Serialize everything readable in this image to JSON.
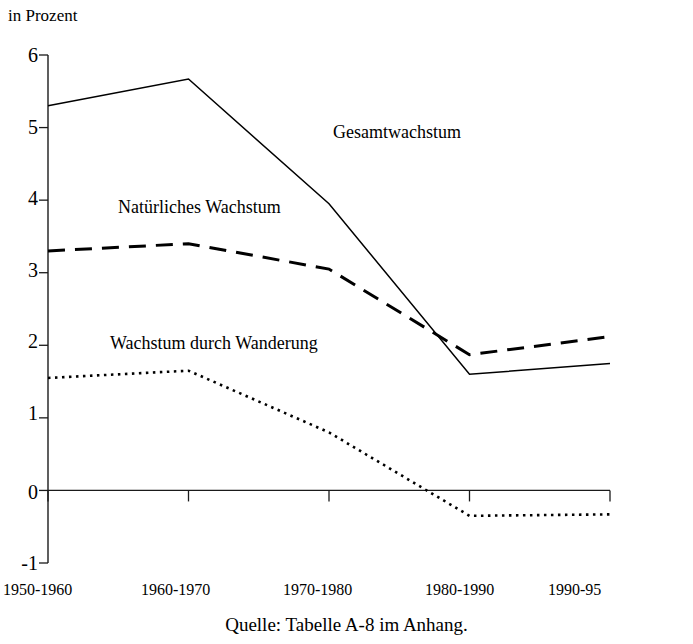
{
  "figure": {
    "unit_label": "in Prozent",
    "source_note": "Quelle: Tabelle A-8 im Anhang."
  },
  "annotations": {
    "total": "Gesamtwachstum",
    "natural": "Natürliches Wachstum",
    "migration": "Wachstum durch Wanderung"
  },
  "axis": {
    "y_ticks": [
      "6",
      "5",
      "4",
      "3",
      "2",
      "1",
      "0",
      "-1"
    ],
    "x_ticks": [
      "1950-1960",
      "1960-1970",
      "1970-1980",
      "1980-1990",
      "1990-95"
    ]
  },
  "colors": {
    "ink": "#000000",
    "background": "#ffffff"
  },
  "chart_data": {
    "type": "line",
    "title": "",
    "subtitle": "",
    "xlabel": "",
    "ylabel": "in Prozent",
    "categories": [
      "1950-1960",
      "1960-1970",
      "1970-1980",
      "1980-1990",
      "1990-95"
    ],
    "ylim": [
      -1,
      6
    ],
    "yticks": [
      -1,
      0,
      1,
      2,
      3,
      4,
      5,
      6
    ],
    "grid": false,
    "legend_position": "inline-annotations",
    "zero_line": true,
    "series": [
      {
        "name": "Gesamtwachstum",
        "style": "solid",
        "values": [
          5.3,
          5.67,
          3.95,
          1.6,
          1.75
        ]
      },
      {
        "name": "Natürliches Wachstum",
        "style": "dashed",
        "values": [
          3.3,
          3.4,
          3.05,
          1.87,
          2.12
        ]
      },
      {
        "name": "Wachstum durch Wanderung",
        "style": "dotted",
        "values": [
          1.55,
          1.65,
          0.8,
          -0.35,
          -0.33
        ]
      }
    ],
    "annotations": [
      {
        "text": "Gesamtwachstum",
        "series": "Gesamtwachstum"
      },
      {
        "text": "Natürliches Wachstum",
        "series": "Natürliches Wachstum"
      },
      {
        "text": "Wachstum durch Wanderung",
        "series": "Wachstum durch Wanderung"
      }
    ]
  }
}
